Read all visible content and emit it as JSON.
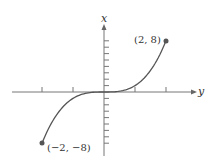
{
  "chart_data": {
    "type": "line",
    "title": "",
    "function": "x = y^3 curve from (-2,-8) to (2,8)",
    "horizontal_axis_label": "y",
    "vertical_axis_label": "x",
    "x": [
      -2,
      -1.5,
      -1,
      -0.5,
      0,
      0.5,
      1,
      1.5,
      2
    ],
    "y": [
      -8,
      -3.375,
      -1,
      -0.125,
      0,
      0.125,
      1,
      3.375,
      8
    ],
    "horizontal_range": [
      -3,
      3
    ],
    "vertical_range": [
      -9,
      9
    ],
    "horizontal_ticks": [
      -2,
      -1,
      1,
      2
    ],
    "vertical_ticks": [
      -8,
      -7,
      -6,
      -5,
      -4,
      -3,
      -2,
      -1,
      1,
      2,
      3,
      4,
      5,
      6,
      7,
      8
    ],
    "endpoints": [
      {
        "label": "(2, 8)",
        "x": 2,
        "y": 8
      },
      {
        "label": "(−2, −8)",
        "x": -2,
        "y": -8
      }
    ],
    "grid": false,
    "legend": false
  },
  "labels": {
    "vertical_axis": "x",
    "horizontal_axis": "y",
    "top_point": "(2, 8)",
    "bottom_point": "(−2, −8)"
  },
  "colors": {
    "curve": "#555555",
    "axis": "#666666",
    "point": "#555555"
  }
}
